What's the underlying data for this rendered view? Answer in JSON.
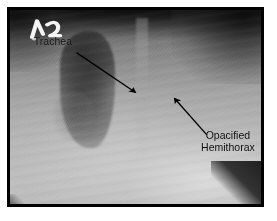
{
  "figure": {
    "type": "chest-radiograph",
    "modality": "X-ray",
    "view": "portable AP chest"
  },
  "frame": {
    "page_background_color": "#ffffff",
    "border_color": "#000000",
    "border_width_px": 3,
    "margin_px": 7
  },
  "image": {
    "background_color": "#9a9a9a",
    "apex_color": "#3a3a3a",
    "lower_field_color": "#c2c2c2",
    "mediastinum_color": "#4a4a4a",
    "corner_wedge_color": "#121212"
  },
  "marker": {
    "name": "radiopaque-side-marker",
    "appearance": "bright metallic positioning marker",
    "color": "#f2f2f2",
    "legible_text": ""
  },
  "annotations": [
    {
      "id": "trachea",
      "label": "Trachea",
      "label_lines": [
        "Trachea"
      ],
      "text_color": "#0a0a0a",
      "arrow": {
        "direction": "down-right",
        "tail_x_pct": 26.5,
        "tail_y_pct": 22.0,
        "head_x_pct": 50.0,
        "head_y_pct": 42.5,
        "color": "#000000",
        "stroke_px": 1.6
      }
    },
    {
      "id": "opacified-hemithorax",
      "label": "Opacified Hemithorax",
      "label_lines": [
        "Opacified",
        "Hemithorax"
      ],
      "text_color": "#0a0a0a",
      "arrow": {
        "direction": "up-left",
        "tail_x_pct": 78.5,
        "tail_y_pct": 64.5,
        "head_x_pct": 65.5,
        "head_y_pct": 45.5,
        "color": "#000000",
        "stroke_px": 1.6
      }
    }
  ]
}
